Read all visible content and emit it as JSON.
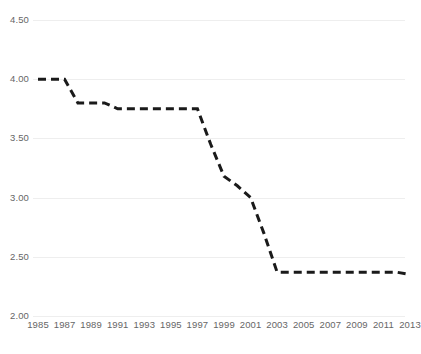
{
  "chart_data": {
    "type": "line",
    "title": "",
    "subtitle": "",
    "xlabel": "",
    "ylabel": "",
    "grid": true,
    "legend": false,
    "legend_position": "none",
    "line_style": "dashed",
    "line_color": "#1a1a1a",
    "grid_color": "#eeeeee",
    "tick_label_color": "#666666",
    "xlim": [
      1985,
      2013
    ],
    "ylim": [
      2.0,
      4.5
    ],
    "y_ticks": [
      2.0,
      2.5,
      3.0,
      3.5,
      4.0,
      4.5
    ],
    "y_tick_labels": [
      "2.00",
      "2.50",
      "3.00",
      "3.50",
      "4.00",
      "4.50"
    ],
    "x_ticks": [
      1985,
      1987,
      1989,
      1991,
      1993,
      1995,
      1997,
      1999,
      2001,
      2003,
      2005,
      2007,
      2009,
      2011,
      2013
    ],
    "x_tick_labels": [
      "1985",
      "1987",
      "1989",
      "1991",
      "1993",
      "1995",
      "1997",
      "1999",
      "2001",
      "2003",
      "2005",
      "2007",
      "2009",
      "2011",
      "2013"
    ],
    "x": [
      1985,
      1986,
      1987,
      1988,
      1989,
      1990,
      1991,
      1992,
      1993,
      1994,
      1995,
      1996,
      1997,
      1998,
      1999,
      2000,
      2001,
      2002,
      2003,
      2004,
      2005,
      2006,
      2007,
      2008,
      2009,
      2010,
      2011,
      2012,
      2013
    ],
    "values": [
      4.0,
      4.0,
      4.0,
      3.8,
      3.8,
      3.8,
      3.75,
      3.75,
      3.75,
      3.75,
      3.75,
      3.75,
      3.75,
      3.45,
      3.18,
      3.1,
      3.0,
      2.7,
      2.37,
      2.37,
      2.37,
      2.37,
      2.37,
      2.37,
      2.37,
      2.37,
      2.37,
      2.37,
      2.35
    ],
    "series": [
      {
        "name": "",
        "values": [
          4.0,
          4.0,
          4.0,
          3.8,
          3.8,
          3.8,
          3.75,
          3.75,
          3.75,
          3.75,
          3.75,
          3.75,
          3.75,
          3.45,
          3.18,
          3.1,
          3.0,
          2.7,
          2.37,
          2.37,
          2.37,
          2.37,
          2.37,
          2.37,
          2.37,
          2.37,
          2.37,
          2.37,
          2.35
        ]
      }
    ]
  }
}
